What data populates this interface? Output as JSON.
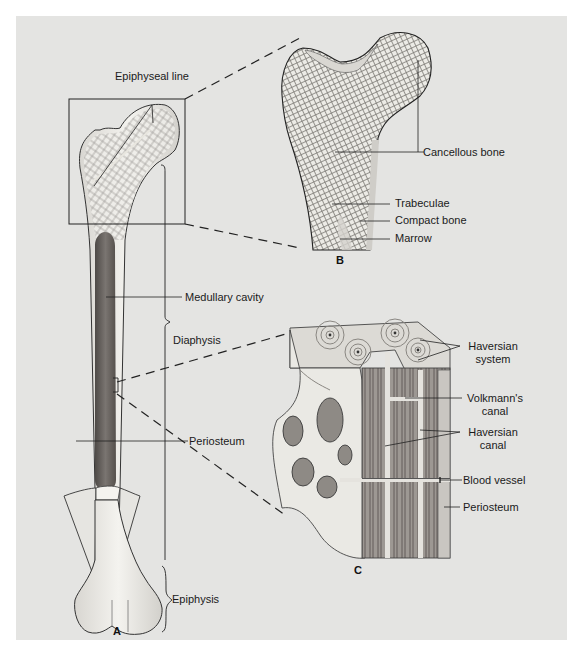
{
  "figure": {
    "panels": [
      {
        "id": "A",
        "label": "A",
        "subject": "whole long bone (femur)"
      },
      {
        "id": "B",
        "label": "B",
        "subject": "enlarged proximal epiphysis"
      },
      {
        "id": "C",
        "label": "C",
        "subject": "enlarged section of compact bone"
      }
    ],
    "labels_a": {
      "epiphyseal_line": "Epiphyseal line",
      "medullary_cavity": "Medullary cavity",
      "diaphysis": "Diaphysis",
      "periosteum": "Periosteum",
      "epiphysis": "Epiphysis"
    },
    "labels_b": {
      "cancellous_bone": "Cancellous bone",
      "trabeculae": "Trabeculae",
      "compact_bone": "Compact bone",
      "marrow": "Marrow"
    },
    "labels_c": {
      "haversian_system_1": "Haversian",
      "haversian_system_2": "system",
      "volkmanns_canal_1": "Volkmann's",
      "volkmanns_canal_2": "canal",
      "haversian_canal_1": "Haversian",
      "haversian_canal_2": "canal",
      "blood_vessel": "Blood vessel",
      "periosteum": "Periosteum"
    },
    "colors": {
      "background": "#e4e4e2",
      "bone": "#f2f1ed",
      "outline": "#333333",
      "marrow": "#6f6a66",
      "shading": "#b8b5b0"
    }
  }
}
